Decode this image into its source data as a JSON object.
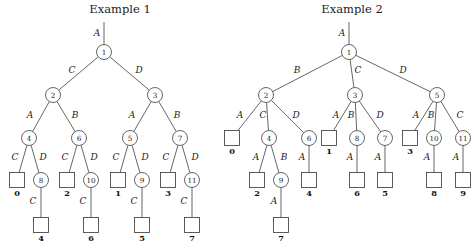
{
  "figure": {
    "background": "#ffffff",
    "stroke_color": "#4a4a4a",
    "text_color": "#1b1b1b",
    "width": 475,
    "height": 248
  },
  "examples": [
    {
      "id": "example-1",
      "title": "Example 1",
      "title_x": 120,
      "title_y": 13,
      "root_stub": {
        "label": "A",
        "x": 104,
        "y_top": 22,
        "y_bottom": 45,
        "label_x": 97,
        "label_y": 36
      },
      "circles": [
        {
          "id": "c1",
          "num": "1",
          "cx": 104,
          "cy": 52,
          "r": 7.5
        },
        {
          "id": "c2",
          "num": "2",
          "cx": 53,
          "cy": 95,
          "r": 7.5
        },
        {
          "id": "c3",
          "num": "3",
          "cx": 155,
          "cy": 95,
          "r": 7.5
        },
        {
          "id": "c4",
          "num": "4",
          "cx": 29,
          "cy": 138,
          "r": 7.5
        },
        {
          "id": "c6",
          "num": "6",
          "cx": 79,
          "cy": 138,
          "r": 7.5
        },
        {
          "id": "c5",
          "num": "5",
          "cx": 130,
          "cy": 138,
          "r": 7.5
        },
        {
          "id": "c7",
          "num": "7",
          "cx": 180,
          "cy": 138,
          "r": 7.5
        },
        {
          "id": "c8",
          "num": "8",
          "cx": 41,
          "cy": 180,
          "r": 7.5
        },
        {
          "id": "c10",
          "num": "10",
          "cx": 91,
          "cy": 180,
          "r": 7.5
        },
        {
          "id": "c9",
          "num": "9",
          "cx": 142,
          "cy": 180,
          "r": 7.5
        },
        {
          "id": "c11",
          "num": "11",
          "cx": 192,
          "cy": 180,
          "r": 7.5
        }
      ],
      "squares": [
        {
          "id": "s0",
          "num": "0",
          "cx": 17,
          "cy": 180,
          "size": 15
        },
        {
          "id": "s2",
          "num": "2",
          "cx": 67,
          "cy": 180,
          "size": 15
        },
        {
          "id": "s1",
          "num": "1",
          "cx": 118,
          "cy": 180,
          "size": 15
        },
        {
          "id": "s3",
          "num": "3",
          "cx": 168,
          "cy": 180,
          "size": 15
        },
        {
          "id": "s4",
          "num": "4",
          "cx": 41,
          "cy": 225,
          "size": 15
        },
        {
          "id": "s6",
          "num": "6",
          "cx": 91,
          "cy": 225,
          "size": 15
        },
        {
          "id": "s5",
          "num": "5",
          "cx": 142,
          "cy": 225,
          "size": 15
        },
        {
          "id": "s7",
          "num": "7",
          "cx": 192,
          "cy": 225,
          "size": 15
        }
      ],
      "edges": [
        {
          "from": "c1",
          "to": "c2",
          "label": "C",
          "lx": 72,
          "ly": 73
        },
        {
          "from": "c1",
          "to": "c3",
          "label": "D",
          "lx": 139,
          "ly": 73
        },
        {
          "from": "c2",
          "to": "c4",
          "label": "A",
          "lx": 30,
          "ly": 118
        },
        {
          "from": "c2",
          "to": "c6",
          "label": "B",
          "lx": 75,
          "ly": 118
        },
        {
          "from": "c3",
          "to": "c5",
          "label": "A",
          "lx": 132,
          "ly": 118
        },
        {
          "from": "c3",
          "to": "c7",
          "label": "B",
          "lx": 177,
          "ly": 118
        },
        {
          "from": "c4",
          "to": "s0",
          "label": "C",
          "lx": 15,
          "ly": 160
        },
        {
          "from": "c4",
          "to": "c8",
          "label": "D",
          "lx": 43,
          "ly": 160
        },
        {
          "from": "c6",
          "to": "s2",
          "label": "C",
          "lx": 65,
          "ly": 160
        },
        {
          "from": "c6",
          "to": "c10",
          "label": "D",
          "lx": 94,
          "ly": 160
        },
        {
          "from": "c5",
          "to": "s1",
          "label": "C",
          "lx": 116,
          "ly": 160
        },
        {
          "from": "c5",
          "to": "c9",
          "label": "D",
          "lx": 145,
          "ly": 160
        },
        {
          "from": "c7",
          "to": "s3",
          "label": "C",
          "lx": 166,
          "ly": 160
        },
        {
          "from": "c7",
          "to": "c11",
          "label": "D",
          "lx": 195,
          "ly": 160
        },
        {
          "from": "c8",
          "to": "s4",
          "label": "C",
          "lx": 33,
          "ly": 204
        },
        {
          "from": "c10",
          "to": "s6",
          "label": "C",
          "lx": 83,
          "ly": 204
        },
        {
          "from": "c9",
          "to": "s5",
          "label": "C",
          "lx": 134,
          "ly": 204
        },
        {
          "from": "c11",
          "to": "s7",
          "label": "C",
          "lx": 184,
          "ly": 204
        }
      ]
    },
    {
      "id": "example-2",
      "title": "Example 2",
      "title_x": 352,
      "title_y": 13,
      "root_stub": {
        "label": "A",
        "x": 349,
        "y_top": 22,
        "y_bottom": 45,
        "label_x": 342,
        "label_y": 36
      },
      "circles": [
        {
          "id": "d1",
          "num": "1",
          "cx": 349,
          "cy": 52,
          "r": 7.5
        },
        {
          "id": "d2",
          "num": "2",
          "cx": 266,
          "cy": 95,
          "r": 7.5
        },
        {
          "id": "d3",
          "num": "3",
          "cx": 355,
          "cy": 95,
          "r": 7.5
        },
        {
          "id": "d5",
          "num": "5",
          "cx": 437,
          "cy": 95,
          "r": 7.5
        },
        {
          "id": "d4",
          "num": "4",
          "cx": 269,
          "cy": 138,
          "r": 7.5
        },
        {
          "id": "d6",
          "num": "6",
          "cx": 309,
          "cy": 138,
          "r": 7.5
        },
        {
          "id": "d8",
          "num": "8",
          "cx": 357,
          "cy": 138,
          "r": 7.5
        },
        {
          "id": "d7",
          "num": "7",
          "cx": 385,
          "cy": 138,
          "r": 7.5
        },
        {
          "id": "d10",
          "num": "10",
          "cx": 434,
          "cy": 138,
          "r": 7.5
        },
        {
          "id": "d11",
          "num": "11",
          "cx": 463,
          "cy": 138,
          "r": 7.5
        },
        {
          "id": "d9",
          "num": "9",
          "cx": 281,
          "cy": 180,
          "r": 7.5
        }
      ],
      "squares": [
        {
          "id": "t0",
          "num": "0",
          "cx": 232,
          "cy": 138,
          "size": 15
        },
        {
          "id": "t1",
          "num": "1",
          "cx": 329,
          "cy": 138,
          "size": 15
        },
        {
          "id": "t3",
          "num": "3",
          "cx": 410,
          "cy": 138,
          "size": 15
        },
        {
          "id": "t2",
          "num": "2",
          "cx": 257,
          "cy": 180,
          "size": 15
        },
        {
          "id": "t4",
          "num": "4",
          "cx": 309,
          "cy": 180,
          "size": 15
        },
        {
          "id": "t6",
          "num": "6",
          "cx": 357,
          "cy": 180,
          "size": 15
        },
        {
          "id": "t5",
          "num": "5",
          "cx": 385,
          "cy": 180,
          "size": 15
        },
        {
          "id": "t8",
          "num": "8",
          "cx": 434,
          "cy": 180,
          "size": 15
        },
        {
          "id": "t9",
          "num": "9",
          "cx": 463,
          "cy": 180,
          "size": 15
        },
        {
          "id": "t7",
          "num": "7",
          "cx": 281,
          "cy": 225,
          "size": 15
        }
      ],
      "edges": [
        {
          "from": "d1",
          "to": "d2",
          "label": "B",
          "lx": 297,
          "ly": 73
        },
        {
          "from": "d1",
          "to": "d3",
          "label": "C",
          "lx": 358,
          "ly": 73
        },
        {
          "from": "d1",
          "to": "d5",
          "label": "D",
          "lx": 403,
          "ly": 73
        },
        {
          "from": "d2",
          "to": "t0",
          "label": "A",
          "lx": 240,
          "ly": 118
        },
        {
          "from": "d2",
          "to": "d4",
          "label": "C",
          "lx": 263,
          "ly": 118
        },
        {
          "from": "d2",
          "to": "d6",
          "label": "D",
          "lx": 296,
          "ly": 118
        },
        {
          "from": "d3",
          "to": "t1",
          "label": "A",
          "lx": 336,
          "ly": 118
        },
        {
          "from": "d3",
          "to": "d8",
          "label": "B",
          "lx": 351,
          "ly": 118
        },
        {
          "from": "d3",
          "to": "d7",
          "label": "D",
          "lx": 380,
          "ly": 118
        },
        {
          "from": "d5",
          "to": "t3",
          "label": "A",
          "lx": 416,
          "ly": 118
        },
        {
          "from": "d5",
          "to": "d10",
          "label": "B",
          "lx": 431,
          "ly": 118
        },
        {
          "from": "d5",
          "to": "d11",
          "label": "C",
          "lx": 460,
          "ly": 118
        },
        {
          "from": "d4",
          "to": "t2",
          "label": "A",
          "lx": 256,
          "ly": 160
        },
        {
          "from": "d4",
          "to": "d9",
          "label": "B",
          "lx": 284,
          "ly": 160
        },
        {
          "from": "d6",
          "to": "t4",
          "label": "A",
          "lx": 302,
          "ly": 160
        },
        {
          "from": "d8",
          "to": "t6",
          "label": "A",
          "lx": 350,
          "ly": 160
        },
        {
          "from": "d7",
          "to": "t5",
          "label": "A",
          "lx": 378,
          "ly": 160
        },
        {
          "from": "d10",
          "to": "t8",
          "label": "A",
          "lx": 427,
          "ly": 160
        },
        {
          "from": "d11",
          "to": "t9",
          "label": "A",
          "lx": 456,
          "ly": 160
        },
        {
          "from": "d9",
          "to": "t7",
          "label": "A",
          "lx": 274,
          "ly": 204
        }
      ]
    }
  ]
}
